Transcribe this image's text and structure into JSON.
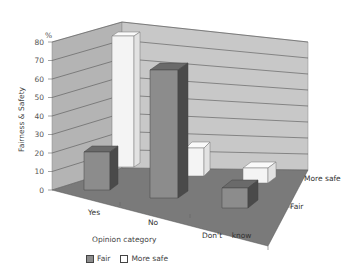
{
  "chart_data": {
    "type": "bar",
    "subtype": "3d-clustered-depth",
    "title": "",
    "xlabel": "Opinion category",
    "ylabel": "Fairness & Safety",
    "yunit": "%",
    "ylim": [
      0,
      80
    ],
    "yticks": [
      0,
      10,
      20,
      30,
      40,
      50,
      60,
      70,
      80
    ],
    "categories": [
      "Yes",
      "No",
      "Don't know"
    ],
    "depth_labels": [
      "Fair",
      "More safe"
    ],
    "series": [
      {
        "name": "Fair",
        "color": "#8c8c8c",
        "values": [
          20,
          65,
          8
        ]
      },
      {
        "name": "More safe",
        "color": "#f5f5f5",
        "values": [
          75,
          10,
          4
        ]
      }
    ],
    "grid": true,
    "legend_position": "bottom-left"
  },
  "labels": {
    "y_unit": "%",
    "y_title": "Fairness & Safety",
    "x_title": "Opinion category",
    "cat_yes": "Yes",
    "cat_no": "No",
    "cat_dk": "Don't    know",
    "depth_fair": "Fair",
    "depth_safe": "More safe",
    "legend_fair": "Fair",
    "legend_safe": "More safe"
  },
  "ticks": [
    "0",
    "10",
    "20",
    "30",
    "40",
    "50",
    "60",
    "70",
    "80"
  ]
}
